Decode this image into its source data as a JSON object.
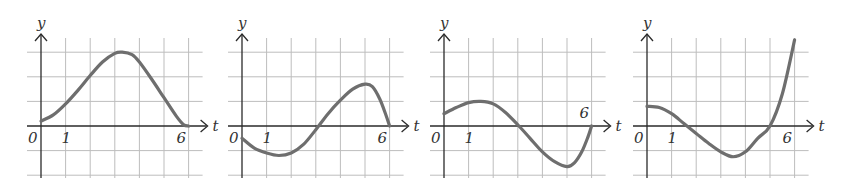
{
  "chart_data": [
    {
      "type": "line",
      "panel": 1,
      "xlabel": "t",
      "ylabel": "y",
      "tick_labels": {
        "origin": "0",
        "one": "1",
        "six": "6"
      },
      "grid": true,
      "xlim": [
        0,
        6.5
      ],
      "ylim": [
        -2,
        3.5
      ],
      "x": [
        0,
        0.5,
        1,
        1.5,
        2,
        2.5,
        3,
        3.3,
        3.7,
        4,
        4.5,
        5,
        5.5,
        5.8,
        6
      ],
      "values": [
        0.2,
        0.45,
        0.9,
        1.45,
        2.05,
        2.6,
        2.95,
        3.0,
        2.9,
        2.6,
        1.9,
        1.15,
        0.4,
        0.05,
        0
      ]
    },
    {
      "type": "line",
      "panel": 2,
      "xlabel": "t",
      "ylabel": "y",
      "tick_labels": {
        "origin": "0",
        "one": "1",
        "six": "6"
      },
      "grid": true,
      "xlim": [
        0,
        6.5
      ],
      "ylim": [
        -2,
        3.5
      ],
      "x": [
        0,
        0.5,
        1,
        1.5,
        2,
        2.5,
        3,
        3.5,
        4,
        4.5,
        5,
        5.3,
        5.6,
        5.85,
        6
      ],
      "values": [
        -0.5,
        -0.9,
        -1.1,
        -1.2,
        -1.1,
        -0.75,
        -0.15,
        0.5,
        1.05,
        1.5,
        1.7,
        1.6,
        1.1,
        0.45,
        0
      ]
    },
    {
      "type": "line",
      "panel": 3,
      "xlabel": "t",
      "ylabel": "y",
      "tick_labels": {
        "origin": "0",
        "one": "1",
        "six": "6"
      },
      "grid": true,
      "xlim": [
        0,
        6.5
      ],
      "ylim": [
        -2,
        3.5
      ],
      "x": [
        0,
        0.5,
        1,
        1.5,
        2,
        2.5,
        3,
        3.5,
        4,
        4.5,
        5,
        5.3,
        5.6,
        5.85,
        6
      ],
      "values": [
        0.5,
        0.75,
        0.95,
        1.0,
        0.9,
        0.55,
        0.05,
        -0.5,
        -1.05,
        -1.45,
        -1.65,
        -1.5,
        -1.05,
        -0.45,
        0
      ]
    },
    {
      "type": "line",
      "panel": 4,
      "xlabel": "t",
      "ylabel": "y",
      "tick_labels": {
        "origin": "0",
        "one": "1",
        "six": "6"
      },
      "grid": true,
      "xlim": [
        0,
        6.5
      ],
      "ylim": [
        -2,
        3.5
      ],
      "x": [
        0,
        0.5,
        1,
        1.5,
        2,
        2.5,
        3,
        3.5,
        4,
        4.5,
        5,
        5.5,
        6
      ],
      "values": [
        0.8,
        0.75,
        0.5,
        0.1,
        -0.3,
        -0.7,
        -1.05,
        -1.25,
        -1.05,
        -0.5,
        0,
        1.3,
        3.5
      ]
    }
  ],
  "style": {
    "curve_color": "#6e6e6e",
    "axis_color": "#2a2a2a",
    "grid_color": "#bdbdbd"
  },
  "panels": [
    {
      "left": 0,
      "origin_x": 41
    },
    {
      "left": 0,
      "origin_x": 242
    },
    {
      "left": 0,
      "origin_x": 444
    },
    {
      "left": 0,
      "origin_x": 647
    }
  ]
}
